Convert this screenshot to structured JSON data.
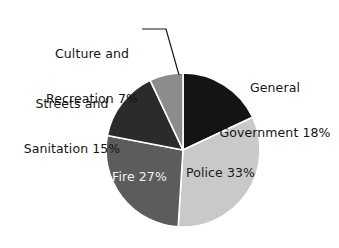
{
  "chart_data": {
    "type": "pie",
    "title": "",
    "subtitle": "",
    "xlabel": "",
    "ylabel": "",
    "grid": false,
    "legend_position": "none",
    "units": "percent",
    "total": 100,
    "start_angle_deg": 0,
    "direction": "clockwise",
    "categories": [
      "General Government",
      "Police",
      "Fire",
      "Streets and Sanitation",
      "Culture and Recreation"
    ],
    "values": [
      18,
      33,
      27,
      15,
      7
    ],
    "slices": [
      {
        "key": "general-government",
        "name": "General Government",
        "value": 18,
        "value_text": "18%",
        "label_line1": "General",
        "label_line2": "Government 18%",
        "label_placement": "outside",
        "color": "#141414",
        "text_color": "#141414",
        "start_deg": 0,
        "end_deg": 64.8
      },
      {
        "key": "police",
        "name": "Police",
        "value": 33,
        "value_text": "33%",
        "label_line1": "Police 33%",
        "label_line2": "",
        "label_placement": "inside",
        "color": "#c9c9c9",
        "text_color": "#1a1a1a",
        "start_deg": 64.8,
        "end_deg": 183.6
      },
      {
        "key": "fire",
        "name": "Fire",
        "value": 27,
        "value_text": "27%",
        "label_line1": "Fire 27%",
        "label_line2": "",
        "label_placement": "inside",
        "color": "#5c5c5c",
        "text_color": "#f2f2f2",
        "start_deg": 183.6,
        "end_deg": 280.8
      },
      {
        "key": "streets-and-sanitation",
        "name": "Streets and Sanitation",
        "value": 15,
        "value_text": "15%",
        "label_line1": "Streets and",
        "label_line2": "Sanitation 15%",
        "label_placement": "outside",
        "color": "#2b2b2b",
        "text_color": "#141414",
        "start_deg": 280.8,
        "end_deg": 334.8
      },
      {
        "key": "culture-and-recreation",
        "name": "Culture and Recreation",
        "value": 7,
        "value_text": "7%",
        "label_line1": "Culture and",
        "label_line2": "Recreation 7%",
        "label_placement": "outside-leader",
        "color": "#8c8c8c",
        "text_color": "#141414",
        "start_deg": 334.8,
        "end_deg": 360
      }
    ]
  },
  "labels": {
    "culture_recreation": {
      "line1": "Culture and",
      "line2": "Recreation 7%"
    },
    "streets_sanitation": {
      "line1": "Streets and",
      "line2": "Sanitation 15%"
    },
    "general_government": {
      "line1": "General",
      "line2": "Government 18%"
    },
    "police": {
      "line1": "Police 33%"
    },
    "fire": {
      "line1": "Fire 27%"
    }
  },
  "style": {
    "background": "#ffffff",
    "slice_border": "#ffffff",
    "leader_line_color": "#141414"
  }
}
